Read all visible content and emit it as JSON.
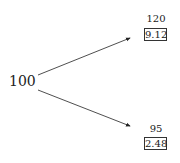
{
  "root": {
    "value": "100"
  },
  "branches": [
    {
      "value": "120",
      "boxed": "9.12"
    },
    {
      "value": "95",
      "boxed": "2.48"
    }
  ]
}
